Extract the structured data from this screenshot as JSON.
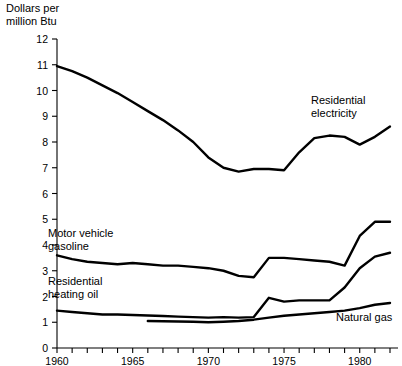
{
  "axis_title": "Dollars per\nmillion Btu",
  "chart_data": {
    "type": "line",
    "title": "Dollars per million Btu",
    "xlabel": "",
    "ylabel": "Dollars per million Btu",
    "xlim": [
      1960,
      1982
    ],
    "ylim": [
      0,
      12
    ],
    "xticks": [
      1960,
      1961,
      1962,
      1963,
      1964,
      1965,
      1966,
      1967,
      1968,
      1969,
      1970,
      1971,
      1972,
      1973,
      1974,
      1975,
      1976,
      1977,
      1978,
      1979,
      1980,
      1981,
      1982
    ],
    "xtick_labels": [
      "1960",
      "",
      "",
      "",
      "",
      "1965",
      "",
      "",
      "",
      "",
      "1970",
      "",
      "",
      "",
      "",
      "1975",
      "",
      "",
      "",
      "",
      "1980",
      "",
      ""
    ],
    "yticks": [
      0,
      1,
      2,
      3,
      4,
      5,
      6,
      7,
      8,
      9,
      10,
      11,
      12
    ],
    "ytick_labels": [
      "0",
      "1",
      "2",
      "3",
      "4",
      "5",
      "6",
      "7",
      "8",
      "9",
      "10",
      "11",
      "12"
    ],
    "grid": false,
    "legend": "inline-annotations",
    "series": [
      {
        "name": "Residential electricity",
        "label_text": "Residential\nelectricity",
        "x": [
          1960,
          1961,
          1962,
          1963,
          1964,
          1965,
          1966,
          1967,
          1968,
          1969,
          1970,
          1971,
          1972,
          1973,
          1974,
          1975,
          1976,
          1977,
          1978,
          1979,
          1980,
          1981,
          1982
        ],
        "values": [
          10.95,
          10.75,
          10.5,
          10.2,
          9.9,
          9.55,
          9.2,
          8.85,
          8.45,
          8.0,
          7.4,
          7.0,
          6.85,
          6.95,
          6.95,
          6.9,
          7.6,
          8.15,
          8.25,
          8.2,
          7.9,
          8.2,
          8.6
        ]
      },
      {
        "name": "Motor vehicle gasoline",
        "label_text": "Motor vehicle\ngasoline",
        "x": [
          1960,
          1961,
          1962,
          1963,
          1964,
          1965,
          1966,
          1967,
          1968,
          1969,
          1970,
          1971,
          1972,
          1973,
          1974,
          1975,
          1976,
          1977,
          1978,
          1979,
          1980,
          1981,
          1982
        ],
        "values": [
          3.6,
          3.45,
          3.35,
          3.3,
          3.25,
          3.3,
          3.25,
          3.2,
          3.2,
          3.15,
          3.1,
          3.0,
          2.8,
          2.75,
          3.5,
          3.5,
          3.45,
          3.4,
          3.35,
          3.2,
          4.35,
          4.9,
          4.9
        ]
      },
      {
        "name": "Residential heating oil",
        "label_text": "Residential\nheating oil",
        "x": [
          1960,
          1961,
          1962,
          1963,
          1964,
          1965,
          1966,
          1967,
          1968,
          1969,
          1970,
          1971,
          1972,
          1973,
          1974,
          1975,
          1976,
          1977,
          1978,
          1979,
          1980,
          1981,
          1982
        ],
        "values": [
          1.45,
          1.4,
          1.35,
          1.3,
          1.3,
          1.28,
          1.26,
          1.24,
          1.22,
          1.2,
          1.18,
          1.2,
          1.18,
          1.2,
          1.95,
          1.8,
          1.85,
          1.85,
          1.85,
          2.35,
          3.1,
          3.55,
          3.7
        ]
      },
      {
        "name": "Natural gas",
        "label_text": "Natural gas",
        "x": [
          1966,
          1967,
          1968,
          1969,
          1970,
          1971,
          1972,
          1973,
          1974,
          1975,
          1976,
          1977,
          1978,
          1979,
          1980,
          1981,
          1982
        ],
        "values": [
          1.05,
          1.04,
          1.03,
          1.02,
          1.0,
          1.02,
          1.05,
          1.1,
          1.18,
          1.25,
          1.3,
          1.35,
          1.4,
          1.45,
          1.55,
          1.68,
          1.75
        ]
      }
    ]
  }
}
